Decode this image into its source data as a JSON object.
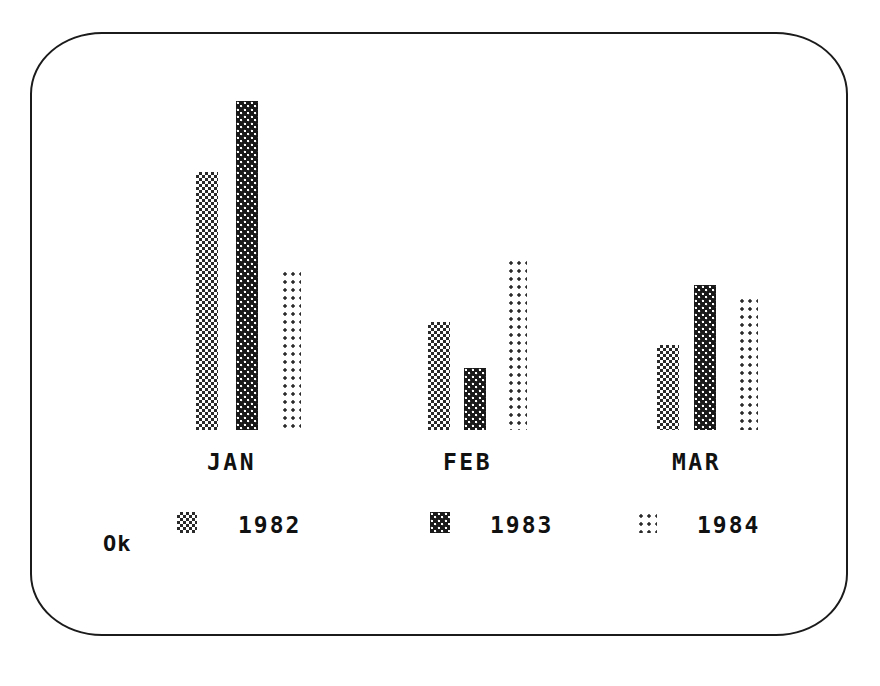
{
  "screen": {
    "type": "crt-monitor-screen",
    "background_color": "#ffffff",
    "border_color": "#1b1b1b"
  },
  "prompt": {
    "text": "Ok"
  },
  "chart_data": {
    "type": "bar",
    "title": "",
    "xlabel": "",
    "ylabel": "",
    "categories": [
      "JAN",
      "FEB",
      "MAR"
    ],
    "series": [
      {
        "name": "1982",
        "values": [
          74,
          33,
          26
        ],
        "pattern": "medium-checker",
        "color": "#2a2a2a"
      },
      {
        "name": "1983",
        "values": [
          100,
          19,
          44
        ],
        "pattern": "dense-dark",
        "color": "#1a1a1a"
      },
      {
        "name": "1984",
        "values": [
          49,
          58,
          41
        ],
        "pattern": "sparse-dots",
        "color": "#2a2a2a"
      }
    ],
    "ylim": [
      0,
      100
    ],
    "grid": false,
    "legend_position": "bottom"
  },
  "bars": [
    {
      "group": "JAN",
      "series": "1982",
      "x": 196,
      "y": 172,
      "width": 22,
      "height": 258
    },
    {
      "group": "JAN",
      "series": "1983",
      "x": 236,
      "y": 101,
      "width": 22,
      "height": 329
    },
    {
      "group": "JAN",
      "series": "1984",
      "x": 281,
      "y": 270,
      "width": 20,
      "height": 160
    },
    {
      "group": "FEB",
      "series": "1982",
      "x": 428,
      "y": 322,
      "width": 22,
      "height": 108
    },
    {
      "group": "FEB",
      "series": "1983",
      "x": 464,
      "y": 368,
      "width": 22,
      "height": 62
    },
    {
      "group": "FEB",
      "series": "1984",
      "x": 507,
      "y": 259,
      "width": 20,
      "height": 171
    },
    {
      "group": "MAR",
      "series": "1982",
      "x": 657,
      "y": 345,
      "width": 22,
      "height": 85
    },
    {
      "group": "MAR",
      "series": "1983",
      "x": 694,
      "y": 285,
      "width": 22,
      "height": 145
    },
    {
      "group": "MAR",
      "series": "1984",
      "x": 738,
      "y": 297,
      "width": 20,
      "height": 133
    }
  ],
  "month_labels": [
    {
      "text": "JAN",
      "x": 207,
      "y": 449
    },
    {
      "text": "FEB",
      "x": 443,
      "y": 449
    },
    {
      "text": "MAR",
      "x": 672,
      "y": 449
    }
  ],
  "legend": {
    "entries": [
      {
        "label": "1982",
        "swatch_x": 177,
        "swatch_y": 512,
        "label_x": 238,
        "label_y": 512
      },
      {
        "label": "1983",
        "swatch_x": 430,
        "swatch_y": 512,
        "label_x": 490,
        "label_y": 512
      },
      {
        "label": "1984",
        "swatch_x": 637,
        "swatch_y": 512,
        "label_x": 697,
        "label_y": 512
      }
    ]
  }
}
